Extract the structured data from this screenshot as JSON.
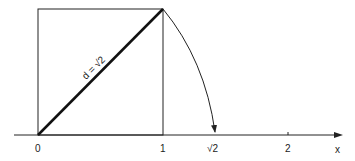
{
  "diagram": {
    "diagonal_label": "d = √2",
    "axis": {
      "label": "x",
      "ticks": [
        {
          "value": 0,
          "label": "0"
        },
        {
          "value": 1,
          "label": "1"
        },
        {
          "value": 1.41421,
          "label": "√2"
        },
        {
          "value": 2,
          "label": "2"
        }
      ]
    },
    "colors": {
      "stroke": "#222222",
      "background": "#ffffff"
    }
  }
}
